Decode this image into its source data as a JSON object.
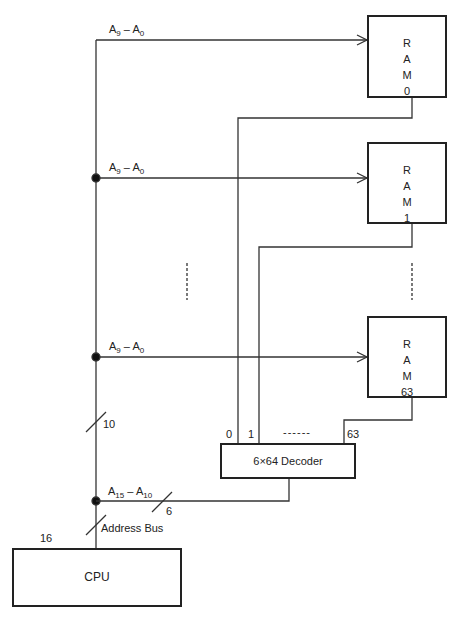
{
  "rams": [
    {
      "letters": [
        "R",
        "A",
        "M"
      ],
      "index": "0"
    },
    {
      "letters": [
        "R",
        "A",
        "M"
      ],
      "index": "1"
    },
    {
      "letters": [
        "R",
        "A",
        "M"
      ],
      "index": "63"
    }
  ],
  "bus_labels": {
    "low_addr": "A",
    "low_hi_sub": "9",
    "low_lo_sub": "0",
    "high_addr": "A",
    "high_hi_sub": "15",
    "high_lo_sub": "10",
    "dash": " – "
  },
  "decoder": {
    "label": "6×64 Decoder",
    "out0": "0",
    "out1": "1",
    "out_dots": "------",
    "out63": "63"
  },
  "bus_widths": {
    "ten": "10",
    "six": "6",
    "sixteen": "16"
  },
  "address_bus_label": "Address Bus",
  "cpu": {
    "label": "CPU"
  }
}
